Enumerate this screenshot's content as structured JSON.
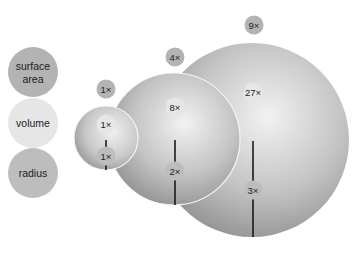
{
  "colors": {
    "surface_area": "#b3b3b3",
    "volume": "#e6e6e6",
    "radius": "#bdbdbd",
    "sphere_dark": "#8f8f8f",
    "sphere_light": "#efefef",
    "radius_line": "#1a1a1a"
  },
  "legend": [
    {
      "key": "surface_area",
      "label_line1": "surface",
      "label_line2": "area"
    },
    {
      "key": "volume",
      "label": "volume"
    },
    {
      "key": "radius",
      "label": "radius"
    }
  ],
  "spheres": [
    {
      "name": "small",
      "surface_area": "1×",
      "volume": "1×",
      "radius": "1×"
    },
    {
      "name": "medium",
      "surface_area": "4×",
      "volume": "8×",
      "radius": "2×"
    },
    {
      "name": "large",
      "surface_area": "9×",
      "volume": "27×",
      "radius": "3×"
    }
  ]
}
